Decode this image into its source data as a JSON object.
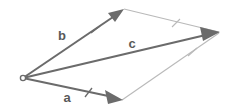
{
  "diagram": {
    "type": "vector-parallelogram",
    "title_visible": false,
    "background_color": "#ffffff",
    "vector_color": "#6b6b6b",
    "construction_line_color": "#b9b9b9",
    "label_color": "#595959",
    "origin": {
      "name": "origin-point",
      "x": 23,
      "y": 78,
      "marker": "open-circle"
    },
    "vectors": [
      {
        "id": "a",
        "label": "a",
        "label_x": 67,
        "label_y": 101,
        "from_x": 23,
        "from_y": 78,
        "to_x": 122,
        "to_y": 99,
        "tick_count": 1,
        "tick_x": 88,
        "tick_y": 93,
        "arrowhead": true
      },
      {
        "id": "b",
        "label": "b",
        "label_x": 62,
        "label_y": 40,
        "from_x": 23,
        "from_y": 78,
        "to_x": 123,
        "to_y": 10,
        "tick_count": 1,
        "tick_x": 95,
        "tick_y": 29,
        "arrowhead": true
      },
      {
        "id": "c",
        "label": "c",
        "label_x": 129,
        "label_y": 48,
        "from_x": 23,
        "from_y": 78,
        "to_x": 219,
        "to_y": 32,
        "tick_count": 0,
        "arrowhead": true
      }
    ],
    "construction_lines": [
      {
        "id": "b-to-resultant",
        "from_x": 124,
        "from_y": 9,
        "to_x": 219,
        "to_y": 32,
        "tick_count": 1,
        "tick_x": 176,
        "tick_y": 23
      },
      {
        "id": "a-to-resultant",
        "from_x": 122,
        "from_y": 100,
        "to_x": 219,
        "to_y": 33,
        "tick_count": 1,
        "tick_x": 192,
        "tick_y": 52
      }
    ]
  }
}
